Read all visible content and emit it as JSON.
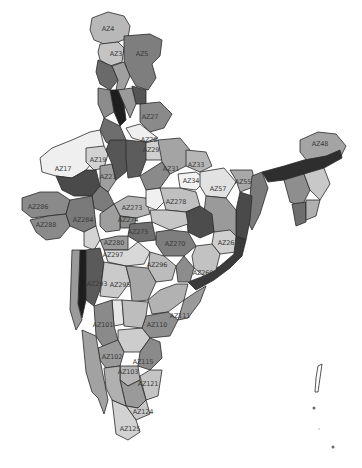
{
  "map": {
    "subject": "India districts/zones grayscale choropleth",
    "palette": {
      "outline": "#2a2a2a",
      "darkest": "#1e1e1e",
      "dark": "#4a4a4a",
      "mid_dark": "#6e6e6e",
      "mid": "#8f8f8f",
      "light": "#b4b4b4",
      "lighter": "#cfcfcf",
      "lightest": "#efefef"
    },
    "labels": [
      {
        "id": "AZ4",
        "text": "AZ4",
        "x": 108,
        "y": 29
      },
      {
        "id": "AZ3",
        "text": "AZ3",
        "x": 116,
        "y": 54
      },
      {
        "id": "AZ5",
        "text": "AZ5",
        "x": 142,
        "y": 54
      },
      {
        "id": "AZ27",
        "text": "AZ27",
        "x": 150,
        "y": 117
      },
      {
        "id": "AZ28",
        "text": "AZ28",
        "x": 149,
        "y": 140
      },
      {
        "id": "AZ29",
        "text": "AZ29",
        "x": 151,
        "y": 150
      },
      {
        "id": "AZ19",
        "text": "AZ19",
        "x": 98,
        "y": 160
      },
      {
        "id": "AZ17",
        "text": "AZ17",
        "x": 63,
        "y": 169
      },
      {
        "id": "AZ21",
        "text": "AZ21",
        "x": 108,
        "y": 177
      },
      {
        "id": "AZ31",
        "text": "AZ31",
        "x": 171,
        "y": 169
      },
      {
        "id": "AZ33",
        "text": "AZ33",
        "x": 196,
        "y": 165
      },
      {
        "id": "AZ34",
        "text": "AZ34",
        "x": 191,
        "y": 181
      },
      {
        "id": "AZ57",
        "text": "AZ57",
        "x": 218,
        "y": 189
      },
      {
        "id": "AZ55",
        "text": "AZ55",
        "x": 243,
        "y": 182
      },
      {
        "id": "AZ48",
        "text": "AZ48",
        "x": 320,
        "y": 144
      },
      {
        "id": "AZ286",
        "text": "AZ286",
        "x": 38,
        "y": 207
      },
      {
        "id": "AZ288",
        "text": "AZ288",
        "x": 46,
        "y": 225
      },
      {
        "id": "AZ284",
        "text": "AZ284",
        "x": 83,
        "y": 220
      },
      {
        "id": "AZ273",
        "text": "AZ273",
        "x": 132,
        "y": 208
      },
      {
        "id": "AZ274",
        "text": "AZ274",
        "x": 128,
        "y": 220
      },
      {
        "id": "AZ275",
        "text": "AZ275",
        "x": 138,
        "y": 232
      },
      {
        "id": "AZ278",
        "text": "AZ278",
        "x": 176,
        "y": 202
      },
      {
        "id": "AZ270",
        "text": "AZ270",
        "x": 175,
        "y": 244
      },
      {
        "id": "AZ261",
        "text": "AZ261",
        "x": 228,
        "y": 243
      },
      {
        "id": "AZ269",
        "text": "AZ269",
        "x": 203,
        "y": 273
      },
      {
        "id": "AZ280",
        "text": "AZ280",
        "x": 114,
        "y": 243
      },
      {
        "id": "AZ297",
        "text": "AZ297",
        "x": 113,
        "y": 255
      },
      {
        "id": "AZ296",
        "text": "AZ296",
        "x": 157,
        "y": 265
      },
      {
        "id": "AZ293",
        "text": "AZ293",
        "x": 97,
        "y": 284
      },
      {
        "id": "AZ295",
        "text": "AZ295",
        "x": 120,
        "y": 285
      },
      {
        "id": "AZ101",
        "text": "AZ101",
        "x": 103,
        "y": 325
      },
      {
        "id": "AZ110",
        "text": "AZ110",
        "x": 157,
        "y": 325
      },
      {
        "id": "AZ111",
        "text": "AZ111",
        "x": 180,
        "y": 316
      },
      {
        "id": "AZ102",
        "text": "AZ102",
        "x": 112,
        "y": 357
      },
      {
        "id": "AZ115",
        "text": "AZ115",
        "x": 143,
        "y": 362
      },
      {
        "id": "AZ103",
        "text": "AZ103",
        "x": 128,
        "y": 372
      },
      {
        "id": "AZ121",
        "text": "AZ121",
        "x": 148,
        "y": 384
      },
      {
        "id": "AZ124",
        "text": "AZ124",
        "x": 143,
        "y": 412
      },
      {
        "id": "AZ125",
        "text": "AZ125",
        "x": 130,
        "y": 429
      }
    ]
  }
}
